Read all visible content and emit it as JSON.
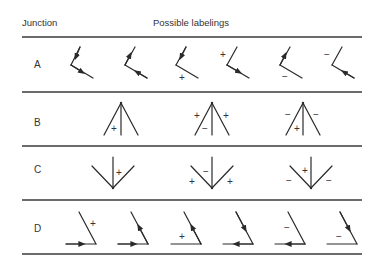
{
  "header": {
    "col1": "Junction",
    "col2": "Possible labelings"
  },
  "rows": [
    {
      "label": "A",
      "junction_type": "L",
      "labelings": [
        {
          "marks": [
            "arrow-in",
            "arrow-out"
          ]
        },
        {
          "marks": [
            "arrow-out",
            "arrow-in"
          ]
        },
        {
          "marks": [
            "arrow-in",
            "+"
          ]
        },
        {
          "marks": [
            "+",
            "arrow-out"
          ]
        },
        {
          "marks": [
            "arrow-out",
            "-"
          ]
        },
        {
          "marks": [
            "-",
            "arrow-in"
          ]
        }
      ]
    },
    {
      "label": "B",
      "junction_type": "Arrow",
      "labelings": [
        {
          "signs": [
            "+"
          ]
        },
        {
          "signs": [
            "+",
            "-",
            "+"
          ]
        },
        {
          "signs": [
            "-",
            "+",
            "-"
          ]
        }
      ]
    },
    {
      "label": "C",
      "junction_type": "Fork",
      "labelings": [
        {
          "signs": [
            "+"
          ]
        },
        {
          "signs": [
            "-",
            "+",
            "+"
          ]
        },
        {
          "signs": [
            "+",
            "-",
            "-"
          ]
        }
      ]
    },
    {
      "label": "D",
      "junction_type": "L",
      "labelings": [
        {
          "marks": [
            "+",
            "arrow-right"
          ]
        },
        {
          "marks": [
            "arrow-up",
            "arrow-right"
          ]
        },
        {
          "marks": [
            "arrow-up",
            "+"
          ]
        },
        {
          "marks": [
            "arrow-down",
            "arrow-left"
          ]
        },
        {
          "marks": [
            "-",
            "arrow-left"
          ]
        },
        {
          "marks": [
            "arrow-down",
            "-"
          ]
        }
      ]
    }
  ],
  "signs": {
    "plus": "+",
    "minus": "−"
  }
}
